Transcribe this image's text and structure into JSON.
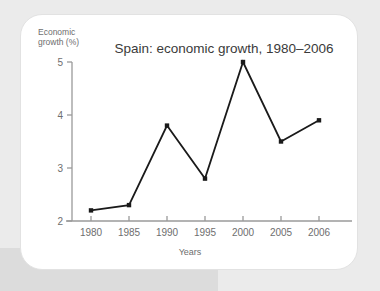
{
  "figure": {
    "card_label": "chart-card"
  },
  "chart_data": {
    "type": "line",
    "title": "Spain: economic growth, 1980–2006",
    "xlabel": "Years",
    "ylabel": "Economic growth (%)",
    "ylabel_line1": "Economic",
    "ylabel_line2": "growth (%)",
    "categories": [
      "1980",
      "1985",
      "1990",
      "1995",
      "2000",
      "2005",
      "2006"
    ],
    "values": [
      2.2,
      2.3,
      3.8,
      2.8,
      5.0,
      3.5,
      3.9
    ],
    "ylim": [
      2,
      5
    ],
    "yticks": [
      2,
      3,
      4,
      5
    ],
    "ytick_labels": [
      "2",
      "3",
      "4",
      "5"
    ],
    "grid": false,
    "legend": null,
    "marker": "square",
    "line_color": "#1a1a1a",
    "marker_color": "#1a1a1a",
    "axis_color": "#9a9a9a",
    "text_color": "#6e6e6e",
    "title_color": "#3a3a3a",
    "spacing": "categorical"
  },
  "colors": {
    "page_background": "#ebebeb",
    "band": "#dcdcdc",
    "card_background": "#ffffff",
    "card_border": "#e2e2e2"
  }
}
